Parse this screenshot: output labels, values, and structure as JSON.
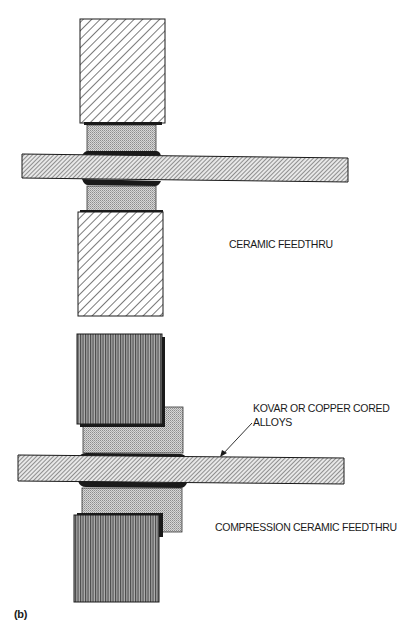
{
  "figure_label": "(b)",
  "figures": [
    {
      "name": "ceramic-feedthru",
      "caption": "CERAMIC FEEDTHRU",
      "parts": {
        "upper_housing": "diagonal-hatch",
        "lower_housing": "diagonal-hatch",
        "ceramic_insulator": "stipple",
        "pin": "fine-diagonal-hatch",
        "braze_joints": "solid-black"
      }
    },
    {
      "name": "compression-ceramic-feedthru",
      "caption": "COMPRESSION CERAMIC FEEDTHRU",
      "callout": {
        "line1": "KOVAR OR COPPER CORED",
        "line2": "ALLOYS"
      },
      "parts": {
        "upper_housing": "vertical-hatch",
        "lower_housing": "vertical-hatch",
        "ceramic_insulator": "stipple",
        "pin": "fine-diagonal-hatch",
        "braze_joints": "solid-black"
      }
    }
  ],
  "colors": {
    "line": "#1a1a1a",
    "ceramic": "#c8c8c8",
    "vertical_hatch_bg": "#8a8a8a"
  }
}
